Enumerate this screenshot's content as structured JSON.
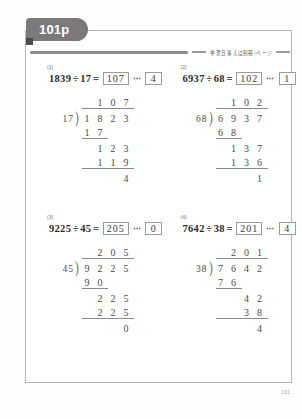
{
  "page": {
    "tab_label": "101p",
    "subtitle": "学習日  答えは別冊○ページ",
    "page_number": "101"
  },
  "problems": [
    {
      "number": "(1)",
      "dividend": "1839",
      "divisor": "17",
      "divide_symbol": "÷",
      "equals": "=",
      "quotient": "107",
      "dots": "⋯",
      "remainder": "4",
      "work": {
        "quotient_digits": [
          "1",
          "0",
          "7"
        ],
        "divisor": "17",
        "paren": ")",
        "dividend_digits": [
          "1",
          "8",
          "2",
          "3"
        ],
        "step1": [
          "1",
          "7"
        ],
        "step2": [
          "1",
          "2",
          "3"
        ],
        "step3": [
          "1",
          "1",
          "9"
        ],
        "final": [
          "4"
        ]
      }
    },
    {
      "number": "(2)",
      "dividend": "6937",
      "divisor": "68",
      "divide_symbol": "÷",
      "equals": "=",
      "quotient": "102",
      "dots": "⋯",
      "remainder": "1",
      "work": {
        "quotient_digits": [
          "1",
          "0",
          "2"
        ],
        "divisor": "68",
        "paren": ")",
        "dividend_digits": [
          "6",
          "9",
          "3",
          "7"
        ],
        "step1": [
          "6",
          "8"
        ],
        "step2": [
          "1",
          "3",
          "7"
        ],
        "step3": [
          "1",
          "3",
          "6"
        ],
        "final": [
          "1"
        ]
      }
    },
    {
      "number": "(3)",
      "dividend": "9225",
      "divisor": "45",
      "divide_symbol": "÷",
      "equals": "=",
      "quotient": "205",
      "dots": "⋯",
      "remainder": "0",
      "work": {
        "quotient_digits": [
          "2",
          "0",
          "5"
        ],
        "divisor": "45",
        "paren": ")",
        "dividend_digits": [
          "9",
          "2",
          "2",
          "5"
        ],
        "step1": [
          "9",
          "0"
        ],
        "step2": [
          "2",
          "2",
          "5"
        ],
        "step3": [
          "2",
          "2",
          "5"
        ],
        "final": [
          "0"
        ]
      }
    },
    {
      "number": "(4)",
      "dividend": "7642",
      "divisor": "38",
      "divide_symbol": "÷",
      "equals": "=",
      "quotient": "201",
      "dots": "⋯",
      "remainder": "4",
      "work": {
        "quotient_digits": [
          "2",
          "0",
          "1"
        ],
        "divisor": "38",
        "paren": ")",
        "dividend_digits": [
          "7",
          "6",
          "4",
          "2"
        ],
        "step1": [
          "7",
          "6"
        ],
        "step2": [
          "4",
          "2"
        ],
        "step3": [
          "3",
          "8"
        ],
        "final": [
          "4"
        ]
      }
    }
  ],
  "colors": {
    "tab_bg": "#7a7a7a",
    "frame": "#b9b9b9",
    "rule": "#8d8d8d",
    "ink": "#4a4a4a"
  }
}
